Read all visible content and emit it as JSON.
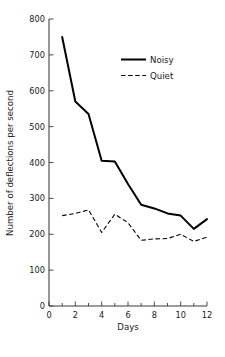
{
  "chart_data": {
    "type": "line",
    "title": "",
    "xlabel": "Days",
    "ylabel": "Number of deflections per second",
    "xlim": [
      0,
      12
    ],
    "ylim": [
      0,
      800
    ],
    "grid": false,
    "legend_position": "upper-right-inside",
    "x": [
      1,
      2,
      3,
      4,
      5,
      6,
      7,
      8,
      9,
      10,
      11,
      12
    ],
    "x_major_ticks": [
      0,
      2,
      4,
      6,
      8,
      10,
      12
    ],
    "x_minor_ticks": [
      1,
      3,
      5,
      7,
      9,
      11
    ],
    "x_tick_labels": [
      "0",
      "2",
      "4",
      "6",
      "8",
      "10",
      "12"
    ],
    "y_major_ticks": [
      0,
      100,
      200,
      300,
      400,
      500,
      600,
      700,
      800
    ],
    "y_tick_labels": [
      "0",
      "100",
      "200",
      "300",
      "400",
      "500",
      "600",
      "700",
      "800"
    ],
    "series": [
      {
        "name": "Noisy",
        "style": "solid",
        "color": "#000000",
        "values": [
          750,
          570,
          535,
          405,
          403,
          340,
          282,
          272,
          258,
          252,
          215,
          242
        ]
      },
      {
        "name": "Quiet",
        "style": "dashed",
        "color": "#000000",
        "values": [
          252,
          258,
          268,
          205,
          256,
          232,
          183,
          187,
          188,
          200,
          180,
          192
        ]
      }
    ]
  },
  "legend": {
    "entries": [
      {
        "label": "Noisy"
      },
      {
        "label": "Quiet"
      }
    ]
  },
  "axes": {
    "x_title": "Days",
    "y_title": "Number of deflections per second"
  }
}
